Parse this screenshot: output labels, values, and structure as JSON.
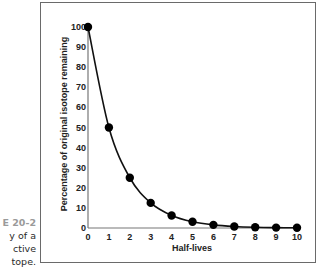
{
  "caption": {
    "figure_number": "E 20-2",
    "lines": [
      "y of a",
      "ctive",
      "tope."
    ]
  },
  "chart_data": {
    "type": "line",
    "title": "",
    "xlabel": "Half-lives",
    "ylabel": "Percentage of original isotope remaining",
    "x": [
      0,
      1,
      2,
      3,
      4,
      5,
      6,
      7,
      8,
      9,
      10
    ],
    "series": [
      {
        "name": "Percentage remaining",
        "values": [
          100,
          50,
          25,
          12.5,
          6.25,
          3.125,
          1.5625,
          0.78,
          0.39,
          0.2,
          0.1
        ],
        "marker": "filled-circle",
        "smooth": true,
        "color": "#111111"
      }
    ],
    "xticks": [
      "0",
      "1",
      "2",
      "3",
      "4",
      "5",
      "6",
      "7",
      "8",
      "9",
      "10"
    ],
    "yticks": [
      "0",
      "10",
      "20",
      "30",
      "40",
      "50",
      "60",
      "70",
      "80",
      "90",
      "100"
    ],
    "xlim": [
      0,
      10
    ],
    "ylim": [
      0,
      100
    ],
    "grid": false,
    "legend": null
  },
  "colors": {
    "axis": "#777777",
    "line": "#111111",
    "marker": "#000000",
    "frame": "#6a6a6a",
    "caption_number": "#9a9a9a"
  }
}
